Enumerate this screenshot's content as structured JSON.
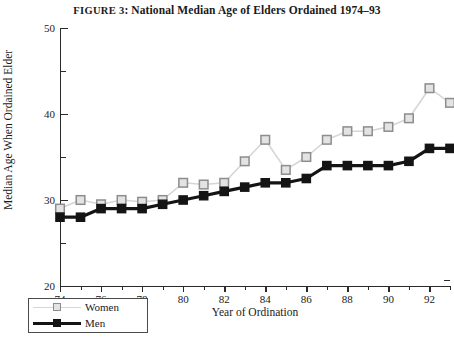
{
  "figure": {
    "label_word": "FIGURE 3",
    "title": "FIGURE 3: National Median Age of Elders Ordained 1974–93",
    "title_prefix": "FIGURE 3",
    "title_rest": ": National Median Age of Elders Ordained 1974–93"
  },
  "legend": {
    "items": [
      {
        "label": "Women",
        "color": "#e3e3e3",
        "line_color": "#d6d6d6",
        "marker": "open-square"
      },
      {
        "label": "Men",
        "color": "#141414",
        "line_color": "#141414",
        "marker": "filled-square"
      }
    ]
  },
  "axes": {
    "y_title": "Median Age When Ordained Elder",
    "x_title": "Year of Ordination",
    "y_major_labels": [
      "20",
      "30",
      "40",
      "50"
    ],
    "y_minor_values": [
      25,
      35,
      45
    ],
    "x_major_labels": [
      "74",
      "76",
      "78",
      "80",
      "82",
      "84",
      "86",
      "88",
      "90",
      "92"
    ],
    "x_minor_labels": [
      "75",
      "77",
      "79",
      "81",
      "83",
      "85",
      "87",
      "89",
      "91",
      "93"
    ]
  },
  "chart_data": {
    "type": "line",
    "title": "FIGURE 3: National Median Age of Elders Ordained 1974–93",
    "xlabel": "Year of Ordination",
    "ylabel": "Median Age When Ordained Elder",
    "xlim": [
      74,
      93
    ],
    "ylim": [
      20,
      50
    ],
    "ytick_major": [
      20,
      30,
      40,
      50
    ],
    "ytick_minor": [
      25,
      35,
      45
    ],
    "xtick_major": [
      74,
      76,
      78,
      80,
      82,
      84,
      86,
      88,
      90,
      92
    ],
    "xtick_minor": [
      75,
      77,
      79,
      81,
      83,
      85,
      87,
      89,
      91,
      93
    ],
    "grid": false,
    "legend_position": "lower-left-outside",
    "x": [
      74,
      75,
      76,
      77,
      78,
      79,
      80,
      81,
      82,
      83,
      84,
      85,
      86,
      87,
      88,
      89,
      90,
      91,
      92,
      93
    ],
    "series": [
      {
        "name": "Women",
        "marker": "open-square",
        "color": "#e3e3e3",
        "edge_color": "#8d8d8d",
        "line_color": "#d6d6d6",
        "values": [
          29.0,
          30.0,
          29.5,
          30.0,
          29.8,
          30.0,
          32.0,
          31.8,
          32.0,
          34.5,
          37.0,
          33.5,
          35.0,
          37.0,
          38.0,
          38.0,
          38.5,
          39.5,
          43.0,
          41.3
        ]
      },
      {
        "name": "Men",
        "marker": "filled-square",
        "color": "#141414",
        "edge_color": "#141414",
        "line_color": "#141414",
        "values": [
          28.0,
          28.0,
          29.0,
          29.0,
          29.0,
          29.5,
          30.0,
          30.5,
          31.0,
          31.5,
          32.0,
          32.0,
          32.5,
          34.0,
          34.0,
          34.0,
          34.0,
          34.5,
          36.0,
          36.0
        ]
      }
    ]
  }
}
